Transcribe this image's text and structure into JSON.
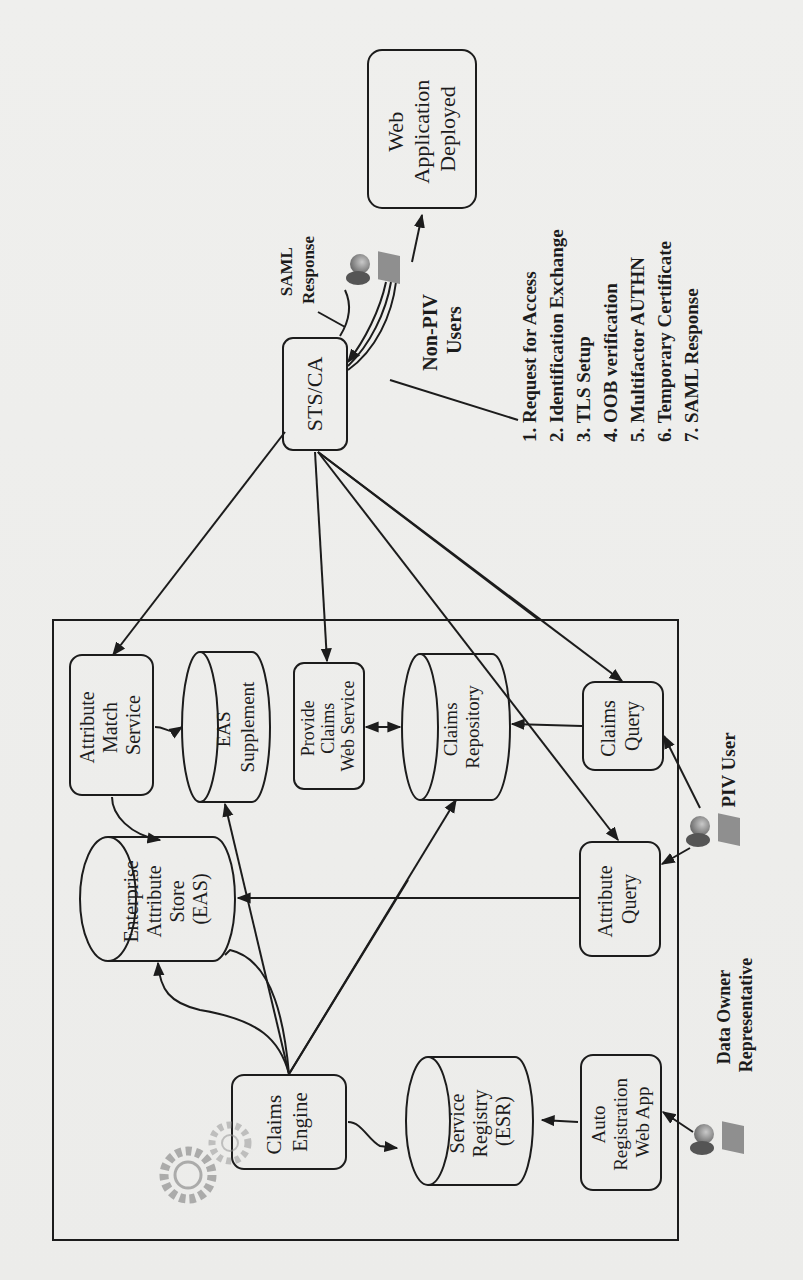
{
  "page": {
    "orientation": "rotated-90-clockwise",
    "background_note": "faint bleed-through text from reverse side (illegible)"
  },
  "diagram": {
    "web_app": {
      "lines": [
        "Web",
        "Application",
        "Deployed"
      ]
    },
    "saml_response_label": {
      "lines": [
        "SAML",
        "Response"
      ]
    },
    "sts_ca": {
      "label": "STS/CA"
    },
    "non_piv_users": {
      "lines": [
        "Non-PIV",
        "Users"
      ]
    },
    "steps": [
      "1. Request for Access",
      "2. Identification  Exchange",
      "3. TLS Setup",
      "4. OOB verification",
      "5. Multifactor AUTHN",
      "6. Temporary Certificate",
      "7. SAML Response"
    ],
    "attribute_match_service": {
      "lines": [
        "Attribute",
        "Match",
        "Service"
      ]
    },
    "eas_supplement": {
      "lines": [
        "EAS",
        "Supplement"
      ]
    },
    "provide_claims_web_service": {
      "lines": [
        "Provide",
        "Claims",
        "Web Service"
      ]
    },
    "claims_repository": {
      "lines": [
        "Claims",
        "Repository"
      ]
    },
    "claims_query": {
      "lines": [
        "Claims",
        "Query"
      ]
    },
    "piv_user": {
      "label": "PIV User"
    },
    "enterprise_attribute_store": {
      "lines": [
        "Enterprise",
        "Attribute",
        "Store",
        "(EAS)"
      ]
    },
    "attribute_query": {
      "lines": [
        "Attribute",
        "Query"
      ]
    },
    "claims_engine": {
      "lines": [
        "Claims",
        "Engine"
      ]
    },
    "service_registry": {
      "lines": [
        "Service",
        "Registry",
        "(ESR)"
      ]
    },
    "auto_registration_web_app": {
      "lines": [
        "Auto",
        "Registration",
        "Web App"
      ]
    },
    "data_owner_representative": {
      "lines": [
        "Data Owner",
        "Representative"
      ]
    }
  },
  "colors": {
    "paper": "#eeeeec",
    "ink": "#1c1c1c",
    "icon_gray": "#8a8a8a"
  }
}
